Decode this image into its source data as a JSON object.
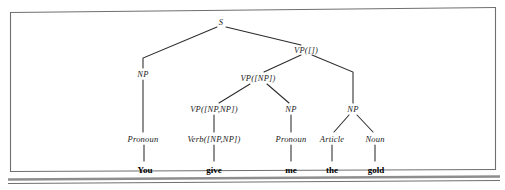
{
  "figure": {
    "type": "syntax-parse-tree",
    "sentence": "You give me the gold",
    "frame": {
      "border_color": "#6b6b6b",
      "shadow_color": "#9a9a9a",
      "background": "#ffffff"
    },
    "line_color": "#2b2b2b"
  },
  "tree": {
    "nodes": [
      {
        "id": "s",
        "label": "S",
        "x": 221,
        "y": 22,
        "kind": "nonterminal"
      },
      {
        "id": "np1",
        "label": "NP",
        "x": 143,
        "y": 74,
        "kind": "nonterminal"
      },
      {
        "id": "vp0",
        "label": "VP([])",
        "x": 306,
        "y": 50,
        "kind": "nonterminal"
      },
      {
        "id": "vp1",
        "label": "VP([NP])",
        "x": 258,
        "y": 78,
        "kind": "nonterminal"
      },
      {
        "id": "np3",
        "label": "NP",
        "x": 353,
        "y": 109,
        "kind": "nonterminal"
      },
      {
        "id": "vp2",
        "label": "VP([NP,NP])",
        "x": 214,
        "y": 109,
        "kind": "nonterminal"
      },
      {
        "id": "np2",
        "label": "NP",
        "x": 291,
        "y": 109,
        "kind": "nonterminal"
      },
      {
        "id": "pronoun1",
        "label": "Pronoun",
        "x": 143,
        "y": 139,
        "kind": "preterminal"
      },
      {
        "id": "verb",
        "label": "Verb([NP,NP])",
        "x": 214,
        "y": 139,
        "kind": "preterminal"
      },
      {
        "id": "pronoun2",
        "label": "Pronoun",
        "x": 291,
        "y": 139,
        "kind": "preterminal"
      },
      {
        "id": "article",
        "label": "Article",
        "x": 332,
        "y": 139,
        "kind": "preterminal"
      },
      {
        "id": "noun",
        "label": "Noun",
        "x": 375,
        "y": 139,
        "kind": "preterminal"
      }
    ],
    "terminals": [
      {
        "id": "w-you",
        "label": "You",
        "x": 145,
        "y": 170
      },
      {
        "id": "w-give",
        "label": "give",
        "x": 214,
        "y": 170
      },
      {
        "id": "w-me",
        "label": "me",
        "x": 291,
        "y": 170
      },
      {
        "id": "w-the",
        "label": "the",
        "x": 332,
        "y": 170
      },
      {
        "id": "w-gold",
        "label": "gold",
        "x": 376,
        "y": 170
      }
    ],
    "edges": [
      {
        "from": "s",
        "to": "np1",
        "style": "elbow"
      },
      {
        "from": "s",
        "to": "vp0",
        "style": "straight"
      },
      {
        "from": "vp0",
        "to": "vp1",
        "style": "straight"
      },
      {
        "from": "vp0",
        "to": "np3",
        "style": "elbow"
      },
      {
        "from": "vp1",
        "to": "vp2",
        "style": "straight"
      },
      {
        "from": "vp1",
        "to": "np2",
        "style": "straight"
      },
      {
        "from": "np3",
        "to": "article",
        "style": "straight"
      },
      {
        "from": "np3",
        "to": "noun",
        "style": "straight"
      },
      {
        "from": "np1",
        "to": "pronoun1",
        "style": "vertical"
      },
      {
        "from": "vp2",
        "to": "verb",
        "style": "vertical"
      },
      {
        "from": "np2",
        "to": "pronoun2",
        "style": "vertical"
      },
      {
        "from": "pronoun1",
        "to": "w-you",
        "style": "vertical"
      },
      {
        "from": "verb",
        "to": "w-give",
        "style": "vertical"
      },
      {
        "from": "pronoun2",
        "to": "w-me",
        "style": "vertical"
      },
      {
        "from": "article",
        "to": "w-the",
        "style": "vertical"
      },
      {
        "from": "noun",
        "to": "w-gold",
        "style": "vertical"
      }
    ]
  }
}
